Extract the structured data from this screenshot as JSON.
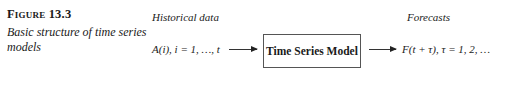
{
  "figure": {
    "label": "Figure 13.3",
    "caption": "Basic structure of time series models"
  },
  "diagram": {
    "input": {
      "heading": "Historical data",
      "expression": "A(i), i = 1, …, t"
    },
    "model": {
      "label": "Time Series Model"
    },
    "output": {
      "heading": "Forecasts",
      "expression": "F(t + τ), τ = 1, 2, …"
    },
    "arrows": [
      {
        "from": "input",
        "to": "model"
      },
      {
        "from": "model",
        "to": "output"
      }
    ]
  }
}
